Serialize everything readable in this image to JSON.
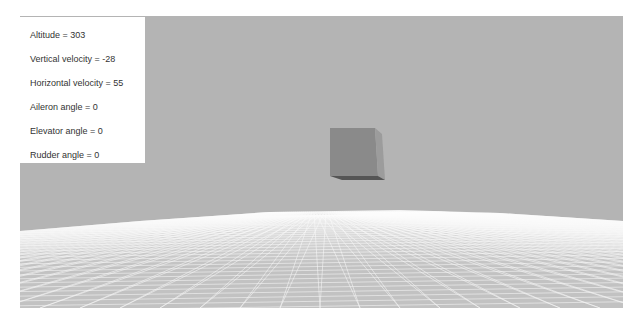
{
  "hud": {
    "altitude": "Altitude = 303",
    "vertical_velocity": "Vertical velocity = -28",
    "horizontal_velocity": "Horizontal velocity = 55",
    "aileron_angle": "Aileron angle = 0",
    "elevator_angle": "Elevator angle = 0",
    "rudder_angle": "Rudder angle = 0"
  },
  "scene": {
    "sky_color": "#b4b4b4",
    "ground_color": "#c4c4c4",
    "grid_color": "#ffffff",
    "cube_front_color": "#8a8a8a",
    "cube_side_color": "#9c9c9c",
    "cube_bottom_color": "#555555"
  }
}
